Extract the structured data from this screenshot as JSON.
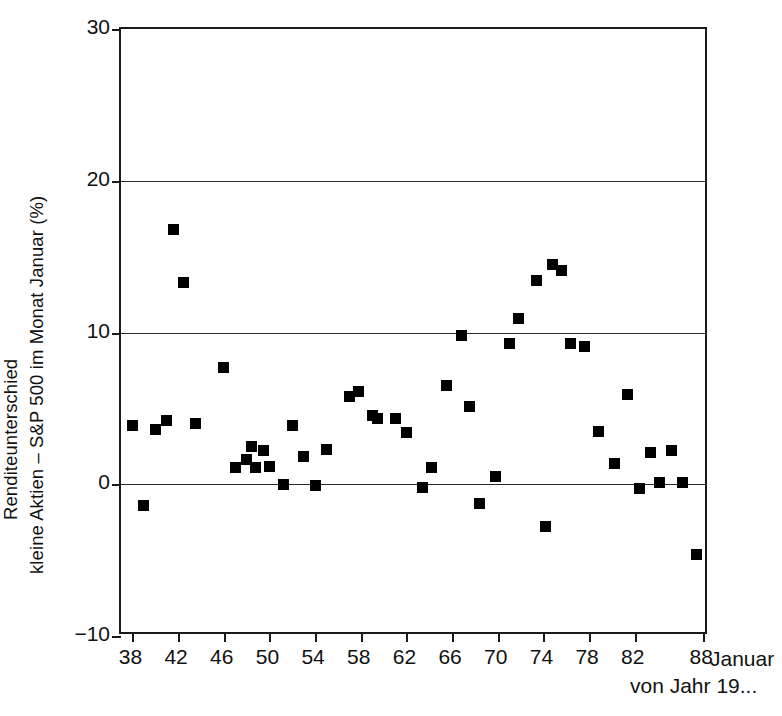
{
  "chart_data": {
    "type": "scatter",
    "title": "",
    "subtitle": "",
    "xlabel": "Januar von Jahr 19...",
    "xlabel_lines": [
      "Januar",
      "von Jahr 19..."
    ],
    "ylabel": "Renditeunterschied kleine Aktien – S&P 500 im Monat Januar (%)",
    "ylabel_lines": [
      "Renditeunterschied",
      "kleine Aktien – S&P 500 im Monat Januar (%)"
    ],
    "xlim": [
      37,
      88.5
    ],
    "ylim": [
      -10,
      30
    ],
    "xticks": [
      38,
      42,
      46,
      50,
      54,
      58,
      62,
      66,
      70,
      74,
      78,
      82,
      88
    ],
    "xtick_labels": [
      "38",
      "42",
      "46",
      "50",
      "54",
      "58",
      "62",
      "66",
      "70",
      "74",
      "78",
      "82",
      "88"
    ],
    "yticks": [
      -10,
      0,
      10,
      20,
      30
    ],
    "ytick_labels": [
      "−10",
      "0",
      "10",
      "20",
      "30"
    ],
    "gridlines_y": [
      0,
      10,
      20
    ],
    "grid": true,
    "legend": null,
    "marker": "square",
    "marker_color": "#000000",
    "x": [
      38,
      39,
      40,
      41,
      42,
      43,
      44,
      45,
      46,
      47,
      48,
      49,
      50,
      51,
      52,
      53,
      54,
      55,
      56,
      57,
      58,
      59,
      60,
      61,
      62,
      63,
      64,
      65,
      66,
      67,
      68,
      69,
      70,
      71,
      72,
      73,
      74,
      75,
      76,
      77,
      78,
      79,
      80,
      81,
      82,
      83,
      84,
      85,
      86,
      87,
      88
    ],
    "y": [
      3.9,
      -1.4,
      3.6,
      16.8,
      13.3,
      4.0,
      7.7,
      1.1,
      1.6,
      2.4,
      1.1,
      1.4,
      0.0,
      3.9,
      1.8,
      -0.1,
      2.3,
      5.8,
      6.1,
      4.5,
      4.2,
      4.7,
      4.3,
      3.4,
      -0.2,
      1.1,
      6.5,
      9.8,
      5.1,
      -1.3,
      0.5,
      9.3,
      10.9,
      13.4,
      14.5,
      -2.8,
      14.1,
      9.3,
      9.1,
      3.5,
      1.4,
      5.9,
      -0.3,
      2.1,
      0.1,
      2.2,
      0.1,
      -4.6
    ],
    "points": [
      {
        "year": 38,
        "value": 3.9
      },
      {
        "year": 39,
        "value": -1.4
      },
      {
        "year": 40,
        "value": 3.6
      },
      {
        "year": 41,
        "value": 4.2
      },
      {
        "year": 41.6,
        "value": 16.8
      },
      {
        "year": 42.5,
        "value": 13.3
      },
      {
        "year": 43.5,
        "value": 4.0
      },
      {
        "year": 46,
        "value": 7.7
      },
      {
        "year": 47,
        "value": 1.1
      },
      {
        "year": 48,
        "value": 1.6
      },
      {
        "year": 48.4,
        "value": 2.5
      },
      {
        "year": 48.8,
        "value": 1.1
      },
      {
        "year": 49.5,
        "value": 2.2
      },
      {
        "year": 50,
        "value": 1.2
      },
      {
        "year": 51.2,
        "value": 0.0
      },
      {
        "year": 52,
        "value": 3.9
      },
      {
        "year": 53,
        "value": 1.8
      },
      {
        "year": 54,
        "value": -0.1
      },
      {
        "year": 55,
        "value": 2.3
      },
      {
        "year": 57,
        "value": 5.8
      },
      {
        "year": 57.8,
        "value": 6.1
      },
      {
        "year": 59,
        "value": 4.5
      },
      {
        "year": 59.5,
        "value": 4.3
      },
      {
        "year": 61,
        "value": 4.3
      },
      {
        "year": 62,
        "value": 3.4
      },
      {
        "year": 63.4,
        "value": -0.2
      },
      {
        "year": 64.2,
        "value": 1.1
      },
      {
        "year": 65.5,
        "value": 6.5
      },
      {
        "year": 66.8,
        "value": 9.8
      },
      {
        "year": 67.5,
        "value": 5.1
      },
      {
        "year": 68.4,
        "value": -1.3
      },
      {
        "year": 69.8,
        "value": 0.5
      },
      {
        "year": 71,
        "value": 9.3
      },
      {
        "year": 71.8,
        "value": 10.9
      },
      {
        "year": 73.4,
        "value": 13.4
      },
      {
        "year": 74.2,
        "value": -2.8
      },
      {
        "year": 74.8,
        "value": 14.5
      },
      {
        "year": 75.6,
        "value": 14.1
      },
      {
        "year": 76.4,
        "value": 9.3
      },
      {
        "year": 77.6,
        "value": 9.1
      },
      {
        "year": 78.8,
        "value": 3.5
      },
      {
        "year": 80.2,
        "value": 1.4
      },
      {
        "year": 81.4,
        "value": 5.9
      },
      {
        "year": 82.4,
        "value": -0.3
      },
      {
        "year": 83.4,
        "value": 2.1
      },
      {
        "year": 84.2,
        "value": 0.1
      },
      {
        "year": 85.2,
        "value": 2.2
      },
      {
        "year": 86.2,
        "value": 0.1
      },
      {
        "year": 87.4,
        "value": -4.6
      }
    ]
  },
  "axes": {
    "x_caption_line1": "Januar",
    "x_caption_line2": "von Jahr 19..."
  }
}
